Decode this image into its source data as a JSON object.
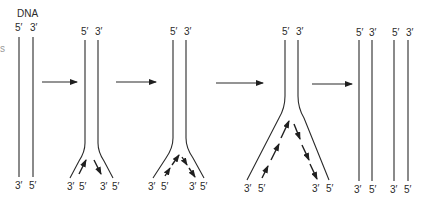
{
  "figure": {
    "title": "DNA",
    "edge_fragment": "s",
    "panels": [
      {
        "name": "parent-duplex",
        "top_labels": [
          "5′",
          "3′"
        ],
        "bottom_labels": [
          "3′",
          "5′"
        ]
      },
      {
        "name": "fork-initiation",
        "top_labels": [
          "5′",
          "3′"
        ],
        "bottom_labels": [
          "3′",
          "5′",
          "3′",
          "5′"
        ]
      },
      {
        "name": "fork-progress",
        "top_labels": [
          "5′",
          "3′"
        ],
        "bottom_labels": [
          "3′",
          "5′",
          "3′",
          "5′"
        ]
      },
      {
        "name": "fork-extended",
        "top_labels": [
          "5′",
          "3′"
        ],
        "bottom_labels": [
          "3′",
          "5′",
          "3′",
          "5′"
        ]
      },
      {
        "name": "daughter-duplexes",
        "top_labels": [
          "5′",
          "3′",
          "5′",
          "3′"
        ],
        "bottom_labels": [
          "3′",
          "5′",
          "3′",
          "5′"
        ]
      }
    ],
    "step_arrows": 4,
    "colors": {
      "ink": "#2a2a2a",
      "background": "#ffffff"
    }
  }
}
